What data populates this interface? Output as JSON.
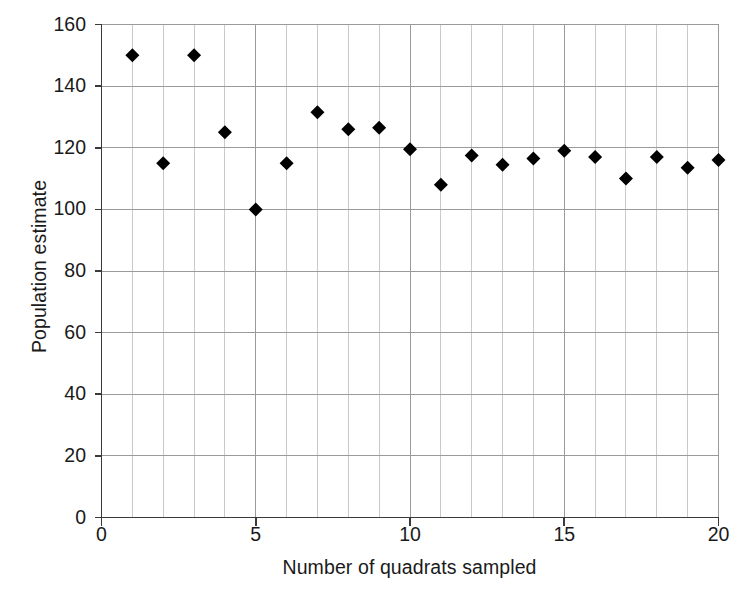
{
  "chart_data": {
    "type": "scatter",
    "title": "",
    "xlabel": "Number of quadrats sampled",
    "ylabel": "Population estimate",
    "xlim": [
      0,
      20
    ],
    "ylim": [
      0,
      160
    ],
    "xticks": [
      0,
      5,
      10,
      15,
      20
    ],
    "yticks": [
      0,
      20,
      40,
      60,
      80,
      100,
      120,
      140,
      160
    ],
    "xtick_labels": [
      "0",
      "5",
      "10",
      "15",
      "20"
    ],
    "ytick_labels": [
      "0",
      "20",
      "40",
      "60",
      "80",
      "100",
      "120",
      "140",
      "160"
    ],
    "grid": true,
    "grid_x_minor_step": 1,
    "grid_y_major_step": 20,
    "legend": null,
    "marker": "diamond",
    "marker_color": "#000000",
    "marker_size_px": 14,
    "x": [
      1,
      2,
      3,
      4,
      5,
      6,
      7,
      8,
      9,
      10,
      11,
      12,
      13,
      14,
      15,
      16,
      17,
      18,
      19,
      20
    ],
    "values": [
      150,
      115,
      150,
      125,
      100,
      115,
      131.5,
      126,
      126.5,
      119.5,
      108,
      117.5,
      114.5,
      116.5,
      119,
      117,
      110,
      117,
      113.5,
      116
    ],
    "points": [
      {
        "x": 1,
        "y": 150
      },
      {
        "x": 2,
        "y": 115
      },
      {
        "x": 3,
        "y": 150
      },
      {
        "x": 4,
        "y": 125
      },
      {
        "x": 5,
        "y": 100
      },
      {
        "x": 6,
        "y": 115
      },
      {
        "x": 7,
        "y": 131.5
      },
      {
        "x": 8,
        "y": 126
      },
      {
        "x": 9,
        "y": 126.5
      },
      {
        "x": 10,
        "y": 119.5
      },
      {
        "x": 11,
        "y": 108
      },
      {
        "x": 12,
        "y": 117.5
      },
      {
        "x": 13,
        "y": 114.5
      },
      {
        "x": 14,
        "y": 116.5
      },
      {
        "x": 15,
        "y": 119
      },
      {
        "x": 16,
        "y": 117
      },
      {
        "x": 17,
        "y": 110
      },
      {
        "x": 18,
        "y": 117
      },
      {
        "x": 19,
        "y": 113.5
      },
      {
        "x": 20,
        "y": 116
      }
    ]
  },
  "axes": {
    "y_title": "Population estimate",
    "x_title": "Number of quadrats sampled"
  },
  "colors": {
    "marker": "#000000",
    "axis": "#3a3a3a",
    "grid_major": "#9a9a9a",
    "grid_minor": "#c9c9c9",
    "background": "#ffffff",
    "text": "#1a1a1a"
  }
}
